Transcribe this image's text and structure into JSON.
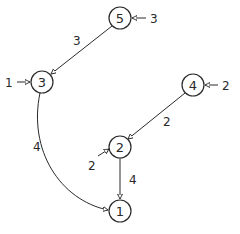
{
  "diagram": {
    "type": "directed-weighted-graph",
    "nodes": [
      {
        "id": "1",
        "label": "1",
        "x": 120,
        "y": 211
      },
      {
        "id": "2",
        "label": "2",
        "x": 120,
        "y": 147
      },
      {
        "id": "3",
        "label": "3",
        "x": 42,
        "y": 82
      },
      {
        "id": "4",
        "label": "4",
        "x": 193,
        "y": 85
      },
      {
        "id": "5",
        "label": "5",
        "x": 120,
        "y": 18
      }
    ],
    "edges": [
      {
        "from": "5",
        "to": "3",
        "weight": "3"
      },
      {
        "from": "3",
        "to": "1",
        "weight": "4"
      },
      {
        "from": "4",
        "to": "2",
        "weight": "2"
      },
      {
        "from": "2",
        "to": "1",
        "weight": "4"
      }
    ],
    "external_inputs": [
      {
        "to": "5",
        "value": "3",
        "side": "right"
      },
      {
        "to": "3",
        "value": "1",
        "side": "left"
      },
      {
        "to": "4",
        "value": "2",
        "side": "right"
      },
      {
        "to": "2",
        "value": "2",
        "side": "lower-left"
      }
    ],
    "colors": {
      "stroke": "#2a2a2a",
      "background": "#ffffff"
    }
  }
}
